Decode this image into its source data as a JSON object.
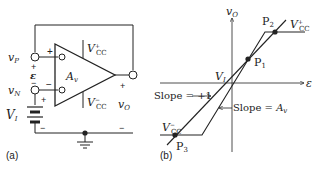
{
  "figure": {
    "panel_a": {
      "label": "(a)",
      "nodes": {
        "vp": "v",
        "vp_sub": "P",
        "vn": "v",
        "vn_sub": "N",
        "vo": "v",
        "vo_sub": "O",
        "eps": "ε",
        "vi": "V",
        "vi_sub": "I",
        "gain": "A",
        "gain_sub": "v",
        "vcc_pos": "V",
        "vcc_pos_sub": "CC",
        "vcc_pos_sup": "+",
        "vcc_neg": "V",
        "vcc_neg_sub": "CC",
        "vcc_neg_sup": "−"
      },
      "signs": {
        "plus_input": "+",
        "minus_input": "−",
        "eps_plus": "+",
        "eps_minus": "−",
        "battery_plus": "+",
        "battery_minus": "−",
        "out_plus": "+",
        "out_minus": "−"
      }
    },
    "panel_b": {
      "label": "(b)",
      "y_axis": "v",
      "y_axis_sub": "O",
      "x_axis": "ε",
      "points": {
        "p1": "P",
        "p1_sub": "1",
        "p2": "P",
        "p2_sub": "2",
        "p3": "P",
        "p3_sub": "3"
      },
      "vi_label": "V",
      "vi_label_sub": "I",
      "vcc_pos": "V",
      "vcc_pos_sub": "CC",
      "vcc_pos_sup": "+",
      "vcc_neg": "V",
      "vcc_neg_sub": "CC",
      "vcc_neg_sup": "−",
      "slope_unity_label": "Slope = +1",
      "slope_gain_label": "Slope = ",
      "slope_gain_sym": "A",
      "slope_gain_sub": "v"
    }
  }
}
